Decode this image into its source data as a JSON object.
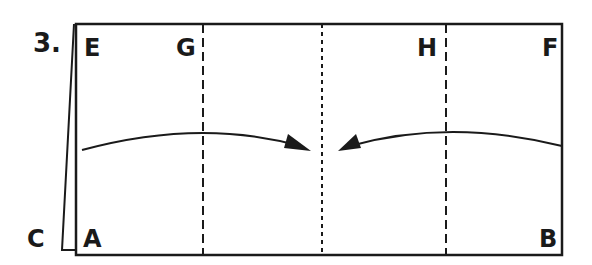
{
  "step": {
    "number": "3."
  },
  "labels": {
    "E": "E",
    "G": "G",
    "H": "H",
    "F": "F",
    "A": "A",
    "B": "B",
    "C": "C"
  },
  "colors": {
    "ink": "#1a1a1a",
    "paper": "#ffffff"
  },
  "diagram": {
    "outer_rect": {
      "x": 75,
      "y": 24,
      "w": 487,
      "h": 230
    },
    "fold_lines": [
      {
        "name": "valley-fold-G",
        "x": 203,
        "style": "dashed"
      },
      {
        "name": "center-line",
        "x": 322,
        "style": "dotted"
      },
      {
        "name": "valley-fold-H",
        "x": 446,
        "style": "dashed"
      }
    ],
    "arrows": [
      {
        "name": "left-flap-arrow",
        "from": "left",
        "to": "center"
      },
      {
        "name": "right-flap-arrow",
        "from": "right",
        "to": "center"
      }
    ]
  }
}
